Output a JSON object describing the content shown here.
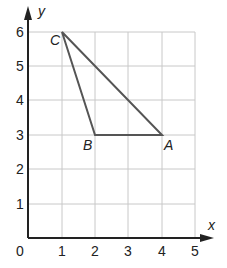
{
  "diagram": {
    "type": "coordinate-grid-triangle",
    "axes": {
      "x_label": "x",
      "y_label": "y",
      "origin_label": "0",
      "x_ticks": [
        "1",
        "2",
        "3",
        "4",
        "5"
      ],
      "y_ticks": [
        "1",
        "2",
        "3",
        "4",
        "5",
        "6"
      ],
      "xlim": [
        0,
        5
      ],
      "ylim": [
        0,
        6
      ]
    },
    "points": [
      {
        "name": "A",
        "x": 4,
        "y": 3
      },
      {
        "name": "B",
        "x": 2,
        "y": 3
      },
      {
        "name": "C",
        "x": 1,
        "y": 6
      }
    ],
    "triangle": [
      "A",
      "B",
      "C"
    ],
    "colors": {
      "grid": "#c8c8c8",
      "axis": "#222222",
      "triangle": "#555555"
    }
  }
}
